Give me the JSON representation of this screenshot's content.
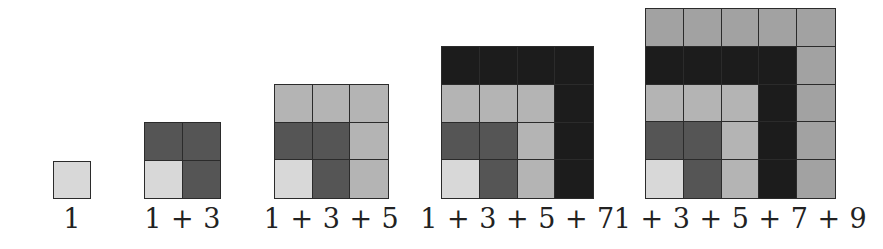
{
  "diagram": {
    "colors": {
      "L1": "#d8d8d8",
      "L2": "#555555",
      "L3": "#b4b4b4",
      "L4": "#1c1c1c",
      "L5": "#a2a2a2"
    },
    "squares": [
      {
        "n": 1,
        "label": "1",
        "left": 53,
        "size": 38,
        "rows": [
          [
            "L1"
          ]
        ]
      },
      {
        "n": 2,
        "label": "1 + 3",
        "left": 144,
        "size": 77,
        "rows": [
          [
            "L2",
            "L2"
          ],
          [
            "L1",
            "L2"
          ]
        ]
      },
      {
        "n": 3,
        "label": "1 + 3 + 5",
        "left": 274,
        "size": 115,
        "rows": [
          [
            "L3",
            "L3",
            "L3"
          ],
          [
            "L2",
            "L2",
            "L3"
          ],
          [
            "L1",
            "L2",
            "L3"
          ]
        ]
      },
      {
        "n": 4,
        "label": "1 + 3 + 5 + 7",
        "left": 441,
        "size": 153,
        "rows": [
          [
            "L4",
            "L4",
            "L4",
            "L4"
          ],
          [
            "L3",
            "L3",
            "L3",
            "L4"
          ],
          [
            "L2",
            "L2",
            "L3",
            "L4"
          ],
          [
            "L1",
            "L2",
            "L3",
            "L4"
          ]
        ]
      },
      {
        "n": 5,
        "label": "1 + 3 + 5 + 7 + 9",
        "left": 645,
        "size": 191,
        "rows": [
          [
            "L5",
            "L5",
            "L5",
            "L5",
            "L5"
          ],
          [
            "L4",
            "L4",
            "L4",
            "L4",
            "L5"
          ],
          [
            "L3",
            "L3",
            "L3",
            "L4",
            "L5"
          ],
          [
            "L2",
            "L2",
            "L3",
            "L4",
            "L5"
          ],
          [
            "L1",
            "L2",
            "L3",
            "L4",
            "L5"
          ]
        ]
      }
    ]
  }
}
